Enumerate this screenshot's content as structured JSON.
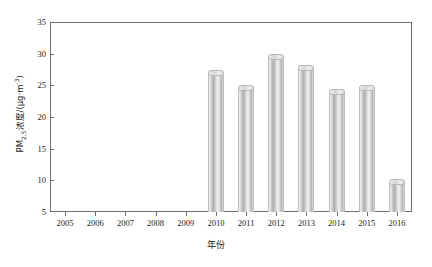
{
  "chart_data": {
    "type": "bar",
    "title": "",
    "xlabel": "年份",
    "ylabel": "PM2.5浓度/(μg·m⁻³)",
    "ylabel_parts": {
      "prefix": "PM",
      "sub": "2.5",
      "mid": "浓度/(μg·m",
      "sup": "-3",
      "suffix": ")"
    },
    "categories": [
      "2005",
      "2006",
      "2007",
      "2008",
      "2009",
      "2010",
      "2011",
      "2012",
      "2013",
      "2014",
      "2015",
      "2016"
    ],
    "values": [
      null,
      null,
      null,
      null,
      null,
      27.0,
      24.6,
      29.5,
      27.8,
      24.0,
      24.6,
      9.8
    ],
    "ylim": [
      5,
      35
    ],
    "yticks": [
      5,
      10,
      15,
      20,
      25,
      30,
      35
    ],
    "ytick_labels": [
      "5",
      "10",
      "15",
      "20",
      "25",
      "30",
      "35"
    ],
    "grid": false,
    "legend": null,
    "series_name": "PM2.5浓度",
    "bar_style": "3d-cylinder-grayscale",
    "colors": {
      "bar_light": "#f2f2f2",
      "bar_mid": "#c4c4c4",
      "bar_dark": "#aeaeae",
      "axis": "#6e6e6e",
      "text": "#1a1a1a",
      "background": "#ffffff"
    }
  }
}
